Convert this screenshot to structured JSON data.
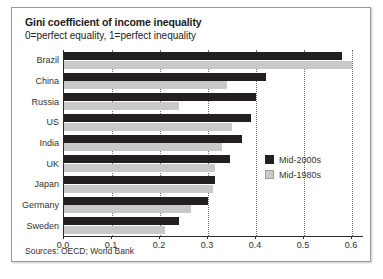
{
  "card": {
    "title": "Gini coefficient of income inequality",
    "subtitle": "0=perfect equality, 1=perfect inequality",
    "sources": "Sources: OECD; World Bank"
  },
  "legend": {
    "items": [
      {
        "label": "Mid-2000s",
        "color": "#231f20"
      },
      {
        "label": "Mid-1980s",
        "color": "#c9c9c7"
      }
    ]
  },
  "chart_data": {
    "type": "bar",
    "orientation": "horizontal",
    "title": "Gini coefficient of income inequality",
    "subtitle": "0=perfect equality, 1=perfect inequality",
    "xlabel": "",
    "ylabel": "",
    "xlim": [
      0.0,
      0.625
    ],
    "xticks": [
      0.0,
      0.1,
      0.2,
      0.3,
      0.4,
      0.5,
      0.6
    ],
    "xtick_labels": [
      "0.0",
      "0.1",
      "0.2",
      "0.3",
      "0.4",
      "0.5",
      "0.6"
    ],
    "grid": "vertical-dotted",
    "legend_position": "bottom-right",
    "categories": [
      "Brazil",
      "China",
      "Russia",
      "US",
      "India",
      "UK",
      "Japan",
      "Germany",
      "Sweden"
    ],
    "series": [
      {
        "name": "Mid-2000s",
        "color": "#231f20",
        "values": [
          0.58,
          0.42,
          0.4,
          0.39,
          0.37,
          0.345,
          0.315,
          0.3,
          0.24
        ]
      },
      {
        "name": "Mid-1980s",
        "color": "#c9c9c7",
        "values": [
          0.6,
          0.34,
          0.24,
          0.35,
          0.33,
          0.315,
          0.31,
          0.265,
          0.21
        ]
      }
    ]
  }
}
